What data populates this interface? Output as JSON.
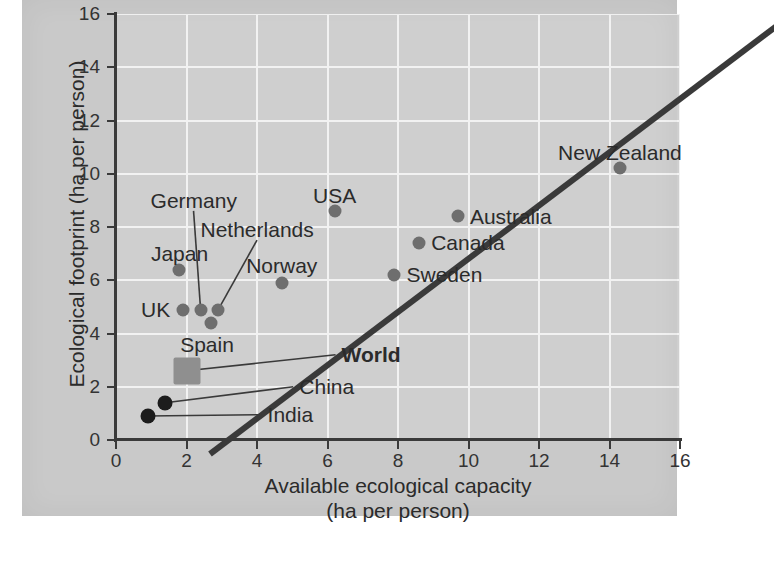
{
  "chart_data": {
    "type": "scatter",
    "title": "",
    "xlabel": "Available ecological capacity\n(ha per person)",
    "xlabel_line1": "Available ecological capacity",
    "xlabel_line2": "(ha per person)",
    "ylabel": "Ecological footprint (ha per person)",
    "xlim": [
      0,
      16
    ],
    "ylim": [
      0,
      16
    ],
    "xticks": [
      "0",
      "2",
      "4",
      "6",
      "8",
      "10",
      "12",
      "14",
      "16"
    ],
    "yticks": [
      "0",
      "2",
      "4",
      "6",
      "8",
      "10",
      "12",
      "14",
      "16"
    ],
    "xtick_values": [
      0,
      2,
      4,
      6,
      8,
      10,
      12,
      14,
      16
    ],
    "ytick_values": [
      0,
      2,
      4,
      6,
      8,
      10,
      12,
      14,
      16
    ],
    "grid": true,
    "legend": "none",
    "reference_line": {
      "name": "footprint equals capacity",
      "type": "identity",
      "from": [
        0,
        0
      ],
      "to": [
        16.8,
        16.8
      ],
      "color": "#3a3a3a"
    },
    "points": [
      {
        "name": "New Zealand",
        "x": 14.3,
        "y": 10.2,
        "marker": "circle",
        "color": "#6e6e6e",
        "label_pos": "above",
        "label_dx": 0,
        "label_dy": -16,
        "label_align": "center",
        "leader": false
      },
      {
        "name": "USA",
        "x": 6.2,
        "y": 8.6,
        "marker": "circle",
        "color": "#6e6e6e",
        "label_pos": "above",
        "label_dx": 0,
        "label_dy": -16,
        "label_align": "center",
        "leader": false
      },
      {
        "name": "Australia",
        "x": 9.7,
        "y": 8.4,
        "marker": "circle",
        "color": "#6e6e6e",
        "label_pos": "right",
        "label_dx": 12,
        "label_dy": 0,
        "label_align": "left",
        "leader": false
      },
      {
        "name": "Canada",
        "x": 8.6,
        "y": 7.4,
        "marker": "circle",
        "color": "#6e6e6e",
        "label_pos": "right",
        "label_dx": 12,
        "label_dy": 0,
        "label_align": "left",
        "leader": false
      },
      {
        "name": "Japan",
        "x": 1.8,
        "y": 6.4,
        "marker": "circle",
        "color": "#6e6e6e",
        "label_pos": "above",
        "label_dx": 0,
        "label_dy": -16,
        "label_align": "center",
        "leader": false
      },
      {
        "name": "Sweden",
        "x": 7.9,
        "y": 6.2,
        "marker": "circle",
        "color": "#6e6e6e",
        "label_pos": "right",
        "label_dx": 12,
        "label_dy": 0,
        "label_align": "left",
        "leader": false
      },
      {
        "name": "Norway",
        "x": 4.7,
        "y": 5.9,
        "marker": "circle",
        "color": "#6e6e6e",
        "label_pos": "above",
        "label_dx": 0,
        "label_dy": -17,
        "label_align": "center",
        "leader": false
      },
      {
        "name": "UK",
        "x": 1.9,
        "y": 4.9,
        "marker": "circle",
        "color": "#6e6e6e",
        "label_pos": "left",
        "label_dx": -13,
        "label_dy": 0,
        "label_align": "right",
        "leader": false
      },
      {
        "name": "Germany",
        "x": 2.4,
        "y": 4.9,
        "marker": "circle",
        "color": "#6e6e6e",
        "label_pos": "leader",
        "label_x": 2.2,
        "label_y": 9.0,
        "label_align": "center",
        "leader": true
      },
      {
        "name": "Netherlands",
        "x": 2.9,
        "y": 4.9,
        "marker": "circle",
        "color": "#6e6e6e",
        "label_pos": "leader",
        "label_x": 4.0,
        "label_y": 7.9,
        "label_align": "center",
        "leader": true
      },
      {
        "name": "Spain",
        "x": 2.7,
        "y": 4.4,
        "marker": "circle",
        "color": "#6e6e6e",
        "label_pos": "below",
        "label_dx": -4,
        "label_dy": 22,
        "label_align": "center",
        "leader": false
      },
      {
        "name": "World",
        "x": 2.0,
        "y": 2.6,
        "marker": "square",
        "color": "#8f8f8f",
        "label_pos": "leader",
        "label_x": 6.4,
        "label_y": 3.2,
        "label_align": "left",
        "leader": true,
        "bold": true
      },
      {
        "name": "China",
        "x": 1.4,
        "y": 1.4,
        "marker": "circle-black",
        "color": "#1c1c1c",
        "label_pos": "leader",
        "label_x": 5.2,
        "label_y": 2.0,
        "label_align": "left",
        "leader": true
      },
      {
        "name": "India",
        "x": 0.9,
        "y": 0.9,
        "marker": "circle-black",
        "color": "#1c1c1c",
        "label_pos": "leader",
        "label_x": 4.3,
        "label_y": 0.95,
        "label_align": "left",
        "leader": true
      }
    ]
  },
  "colors": {
    "page_background": "#ffffff",
    "panel_background": "#c9c9c9",
    "plot_background": "#cfcfcf",
    "gridline": "#f2f2f2",
    "axis": "#3a3a3a",
    "marker_gray": "#6e6e6e",
    "marker_black": "#1c1c1c",
    "marker_square": "#8f8f8f",
    "text": "#2b2b2b"
  }
}
